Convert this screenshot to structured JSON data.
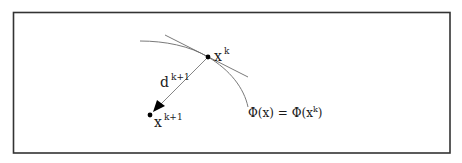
{
  "diagram": {
    "type": "descent-direction-sketch",
    "frame": {
      "x": 13,
      "y": 12,
      "width": 437,
      "height": 141,
      "stroke": "#333333"
    },
    "colors": {
      "curve": "#7a7a7a",
      "tangent": "#6a6a6a",
      "direction": "#777777",
      "points": "#000000",
      "text": "#1a1a1a"
    },
    "points": {
      "current": {
        "x": 208,
        "y": 57,
        "label_base": "x",
        "label_sup": "k"
      },
      "next": {
        "x": 150,
        "y": 115,
        "label_base": "x",
        "label_sup": "k+1"
      }
    },
    "direction": {
      "label_base": "d",
      "label_sup": "k+1"
    },
    "level_set": {
      "label_lhs": "Φ(x)",
      "label_eq": "=",
      "label_rhs_pre": "Φ(x",
      "label_rhs_sup": "k",
      "label_rhs_post": ")"
    }
  }
}
